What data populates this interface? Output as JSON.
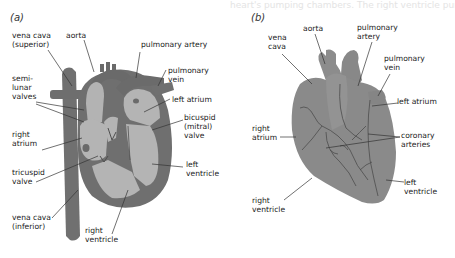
{
  "bleed_through_text": "heart's pumping chambers. The right ventricle pumps",
  "panels": [
    {
      "id": "a",
      "label": "(a)",
      "view": "cross-section",
      "labels": {
        "vena_cava_superior": [
          "vena cava",
          "(superior)"
        ],
        "aorta": [
          "aorta"
        ],
        "pulmonary_artery": [
          "pulmonary artery"
        ],
        "pulmonary_vein": [
          "pulmonary",
          "vein"
        ],
        "semilunar_valves": [
          "semi-",
          "lunar",
          "valves"
        ],
        "left_atrium": [
          "left atrium"
        ],
        "bicuspid_valve": [
          "bicuspid",
          "(mitral)",
          "valve"
        ],
        "right_atrium": [
          "right",
          "atrium"
        ],
        "tricuspid_valve": [
          "tricuspid",
          "valve"
        ],
        "left_ventricle": [
          "left",
          "ventricle"
        ],
        "vena_cava_inferior": [
          "vena cava",
          "(inferior)"
        ],
        "right_ventricle": [
          "right",
          "ventricle"
        ]
      }
    },
    {
      "id": "b",
      "label": "(b)",
      "view": "external",
      "labels": {
        "vena_cava": [
          "vena",
          "cava"
        ],
        "aorta": [
          "aorta"
        ],
        "pulmonary_artery": [
          "pulmonary",
          "artery"
        ],
        "pulmonary_vein": [
          "pulmonary",
          "vein"
        ],
        "left_atrium": [
          "left atrium"
        ],
        "right_atrium": [
          "right",
          "atrium"
        ],
        "coronary_arteries": [
          "coronary",
          "arteries"
        ],
        "left_ventricle": [
          "left",
          "ventricle"
        ],
        "right_ventricle": [
          "right",
          "ventricle"
        ]
      }
    }
  ],
  "colors": {
    "background": "#ffffff",
    "dark_tissue": "#6f6f6f",
    "light_chamber": "#b4b4b4",
    "external_heart": "#8a8a8a",
    "vessel_lines": "#4a4a4a",
    "leader_lines": "#333333",
    "text": "#222222"
  }
}
